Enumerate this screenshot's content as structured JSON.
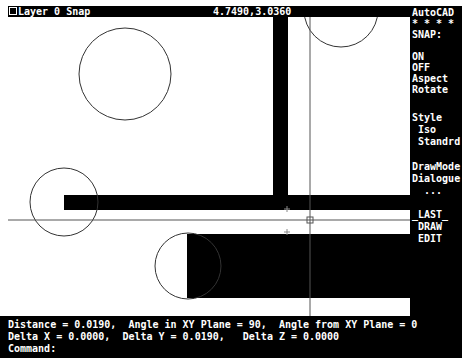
{
  "status": {
    "layer": "Layer 0 Snap",
    "coordinates": "4.7490,3.0360"
  },
  "sidebar": {
    "title": "AutoCAD",
    "stars": "* * * *",
    "menu_header": "SNAP:",
    "items": [
      "ON",
      "OFF",
      "Aspect",
      "Rotate",
      "Style",
      " Iso",
      " Standrd",
      "DrawMode",
      "Dialogue",
      "  ...",
      "_LAST_",
      " DRAW",
      " EDIT"
    ]
  },
  "command": {
    "line1": "Distance = 0.0190,  Angle in XY Plane = 90,  Angle from XY Plane = 0",
    "line2": "Delta X = 0.0000,  Delta Y = 0.0190,   Delta Z = 0.0000",
    "line3": "Command:"
  },
  "colors": {
    "background": "#ffffff",
    "ink": "#000000",
    "crosshair": "#555555"
  }
}
